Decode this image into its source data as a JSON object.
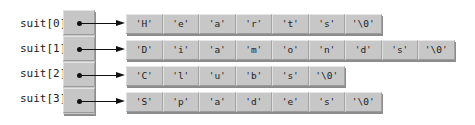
{
  "diagram": {
    "title": "",
    "array_name": "suit",
    "rows": [
      {
        "label": "suit[0]",
        "chars": [
          "'H'",
          "'e'",
          "'a'",
          "'r'",
          "'t'",
          "'s'",
          "'\\0'"
        ]
      },
      {
        "label": "suit[1]",
        "chars": [
          "'D'",
          "'i'",
          "'a'",
          "'m'",
          "'o'",
          "'n'",
          "'d'",
          "'s'",
          "'\\0'"
        ]
      },
      {
        "label": "suit[2]",
        "chars": [
          "'C'",
          "'l'",
          "'u'",
          "'b'",
          "'s'",
          "'\\0'"
        ]
      },
      {
        "label": "suit[3]",
        "chars": [
          "'S'",
          "'p'",
          "'a'",
          "'d'",
          "'e'",
          "'s'",
          "'\\0'"
        ]
      }
    ],
    "colors": {
      "cell_face": "#c7c7c7",
      "cell_shadow": "#8c8c8c",
      "arrow": "#111111",
      "background": "#ffffff"
    }
  }
}
